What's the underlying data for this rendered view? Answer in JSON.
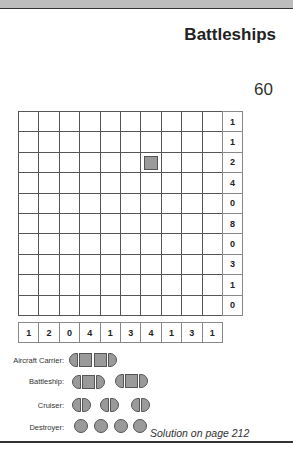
{
  "header": {
    "title": "Battleships",
    "puzzle_number": "60"
  },
  "puzzle": {
    "rows": 10,
    "cols": 10,
    "row_clues": [
      "1",
      "1",
      "2",
      "4",
      "0",
      "8",
      "0",
      "3",
      "1",
      "0"
    ],
    "col_clues": [
      "1",
      "2",
      "0",
      "4",
      "1",
      "3",
      "4",
      "1",
      "3",
      "1"
    ],
    "given_cells": [
      {
        "row": 2,
        "col": 6,
        "type": "middle-segment"
      }
    ]
  },
  "fleet": {
    "carrier_label": "Aircraft Carrier:",
    "battleship_label": "Battleship:",
    "cruiser_label": "Cruiser:",
    "destroyer_label": "Destroyer:",
    "carrier_count": 1,
    "battleship_count": 2,
    "cruiser_count": 3,
    "destroyer_count": 4
  },
  "footer": {
    "solution_text": "Solution on page 212"
  }
}
